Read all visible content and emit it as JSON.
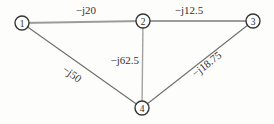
{
  "diagram": {
    "type": "reactance-network-oneline",
    "nodes": [
      {
        "id": "1",
        "label": "1"
      },
      {
        "id": "2",
        "label": "2"
      },
      {
        "id": "3",
        "label": "3"
      },
      {
        "id": "4",
        "label": "4"
      }
    ],
    "edges": [
      {
        "from": "1",
        "to": "2",
        "label": "−j20"
      },
      {
        "from": "2",
        "to": "3",
        "label": "−j12.5"
      },
      {
        "from": "2",
        "to": "4",
        "label": "−j62.5"
      },
      {
        "from": "1",
        "to": "4",
        "label": "−j50"
      },
      {
        "from": "3",
        "to": "4",
        "label": "−j18.75"
      }
    ],
    "colors": {
      "background": "#fdfdfb",
      "horizontal_line": "#9c9c9c",
      "vertical_line": "#a2a2a2",
      "diagonal_line": "#6e6e6e",
      "node_stroke": "#353535",
      "text": "#333333"
    }
  }
}
